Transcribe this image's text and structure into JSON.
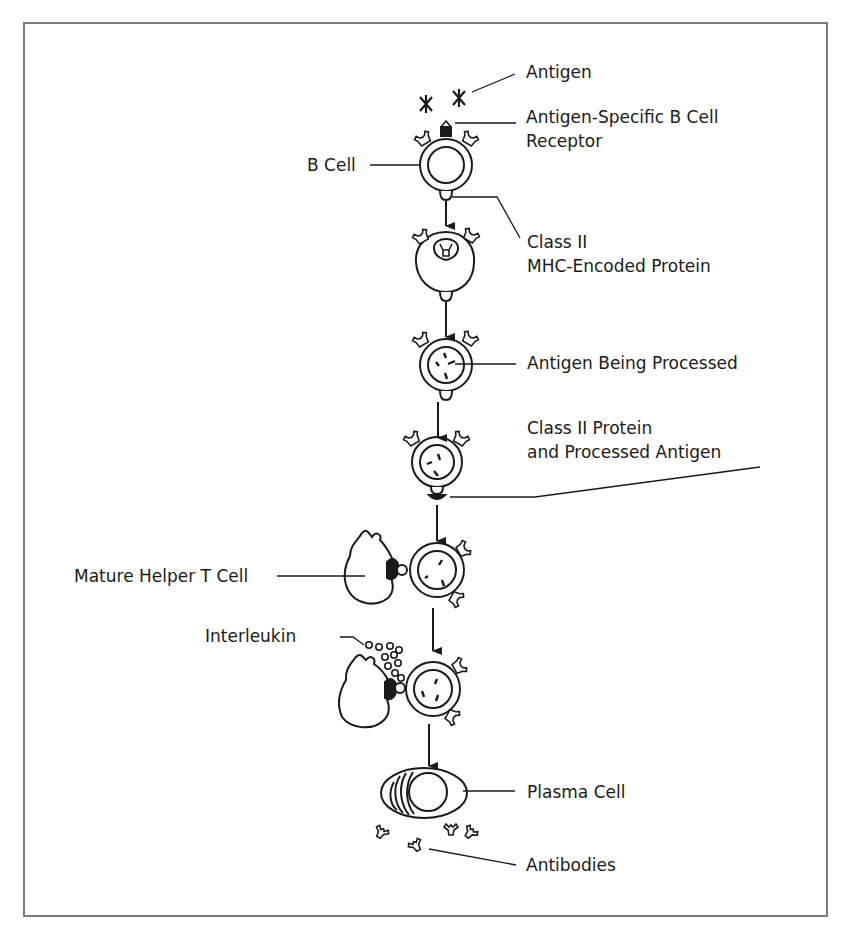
{
  "diagram": {
    "colors": {
      "ink": "#1a1a1a",
      "frame": "#7a7a7a",
      "background": "#ffffff"
    },
    "stages": [
      "B cell with antigen-specific receptor binds antigen",
      "Antigen internalized via receptor",
      "Antigen being processed",
      "Class II protein presents processed antigen",
      "Mature helper T cell binds B cell",
      "Helper T cell releases interleukin",
      "B cell becomes plasma cell releasing antibodies"
    ],
    "labels": {
      "antigen": "Antigen",
      "receptor_line1": "Antigen-Specific B Cell",
      "receptor_line2": "Receptor",
      "b_cell": "B Cell",
      "class2_line1": "Class II",
      "class2_line2": "MHC-Encoded Protein",
      "processing": "Antigen Being Processed",
      "presenting_line1": "Class II Protein",
      "presenting_line2": "and Processed Antigen",
      "helper_t": "Mature Helper T Cell",
      "interleukin": "Interleukin",
      "plasma": "Plasma Cell",
      "antibodies": "Antibodies"
    }
  }
}
